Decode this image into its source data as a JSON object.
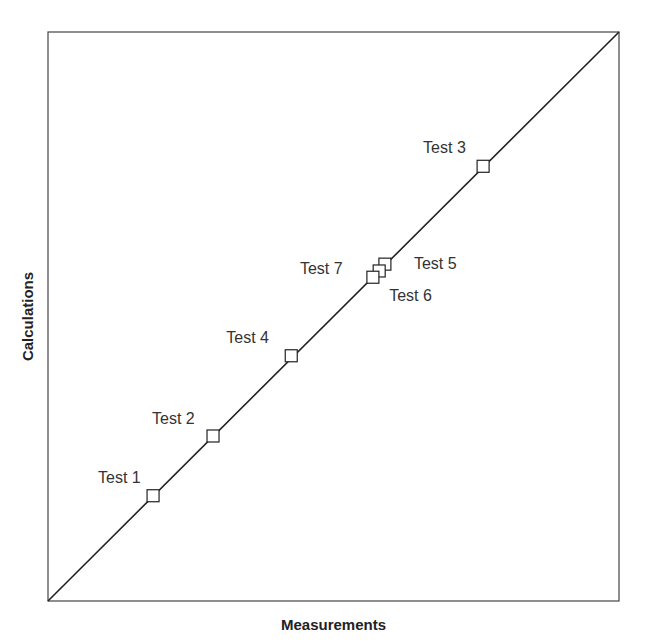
{
  "chart_data": {
    "type": "scatter",
    "title": "",
    "xlabel": "Measurements",
    "ylabel": "Calculations",
    "xlim": [
      0,
      1
    ],
    "ylim": [
      0,
      1
    ],
    "grid": false,
    "legend": null,
    "ticks": "none",
    "reference_line": {
      "type": "y=x",
      "from": [
        0,
        0
      ],
      "to": [
        1,
        1
      ]
    },
    "marker": "open-square",
    "points": [
      {
        "label": "Test 1",
        "x": 0.184,
        "y": 0.185,
        "label_pos": "upper-left"
      },
      {
        "label": "Test 2",
        "x": 0.289,
        "y": 0.29,
        "label_pos": "upper-left"
      },
      {
        "label": "Test 3",
        "x": 0.762,
        "y": 0.764,
        "label_pos": "upper-left"
      },
      {
        "label": "Test 4",
        "x": 0.426,
        "y": 0.431,
        "label_pos": "upper-left"
      },
      {
        "label": "Test 5",
        "x": 0.59,
        "y": 0.592,
        "label_pos": "right"
      },
      {
        "label": "Test 6",
        "x": 0.58,
        "y": 0.58,
        "label_pos": "lower-right"
      },
      {
        "label": "Test 7",
        "x": 0.569,
        "y": 0.569,
        "label_pos": "left"
      }
    ]
  },
  "plot": {
    "box": {
      "left": 48,
      "top": 32,
      "width": 571,
      "height": 569
    },
    "colors": {
      "line": "#222222",
      "frame": "#444444",
      "marker_stroke": "#222222",
      "marker_fill": "#ffffff",
      "text": "#333333"
    },
    "label_offsets": {
      "Test 1": [
        -55,
        -13
      ],
      "Test 2": [
        -61,
        -12
      ],
      "Test 3": [
        -60,
        -13
      ],
      "Test 4": [
        -65,
        -13
      ],
      "Test 5": [
        29,
        5
      ],
      "Test 6": [
        10,
        30
      ],
      "Test 7": [
        -73,
        -3
      ]
    }
  }
}
